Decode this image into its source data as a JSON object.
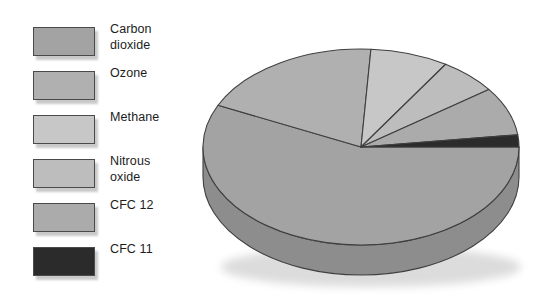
{
  "figure": {
    "kind": "3d-pie-chart",
    "background": "#ffffff"
  },
  "legend": {
    "position": "left",
    "items": [
      {
        "label": "Carbon\ndioxide",
        "name": "carbon-dioxide",
        "color": "#a3a3a3"
      },
      {
        "label": "Ozone",
        "name": "ozone",
        "color": "#b0b0b0"
      },
      {
        "label": "Methane",
        "name": "methane",
        "color": "#c7c7c7"
      },
      {
        "label": "Nitrous\noxide",
        "name": "nitrous-oxide",
        "color": "#bdbdbd"
      },
      {
        "label": "CFC 12",
        "name": "cfc-12",
        "color": "#ababab"
      },
      {
        "label": "CFC 11",
        "name": "cfc-11",
        "color": "#2b2b2b"
      }
    ]
  },
  "chart_data": {
    "type": "pie",
    "title": "",
    "subtitle": "",
    "xlabel": "",
    "ylabel": "",
    "three_d": true,
    "legend_position": "left",
    "grid": false,
    "start_angle_deg": 0,
    "direction": "clockwise",
    "categories": [
      "Carbon dioxide",
      "Ozone",
      "Methane",
      "Nitrous oxide",
      "CFC 12",
      "CFC 11"
    ],
    "values": [
      57,
      19,
      8,
      6,
      8,
      2
    ],
    "units": "percent",
    "slices": [
      {
        "label": "Carbon dioxide",
        "value": 57,
        "color": "#a3a3a3",
        "side_color": "#8d8d8d"
      },
      {
        "label": "Ozone",
        "value": 19,
        "color": "#b0b0b0",
        "side_color": "#9a9a9a"
      },
      {
        "label": "Methane",
        "value": 8,
        "color": "#c7c7c7",
        "side_color": "#ababab"
      },
      {
        "label": "Nitrous oxide",
        "value": 6,
        "color": "#bdbdbd",
        "side_color": "#a2a2a2"
      },
      {
        "label": "CFC 12",
        "value": 8,
        "color": "#ababab",
        "side_color": "#949494"
      },
      {
        "label": "CFC 11",
        "value": 2,
        "color": "#2b2b2b",
        "side_color": "#1e1e1e"
      }
    ]
  },
  "colors": {
    "outline": "#3f3f3f",
    "text": "#1c1c1c",
    "shadow": "#d2d2d2"
  }
}
